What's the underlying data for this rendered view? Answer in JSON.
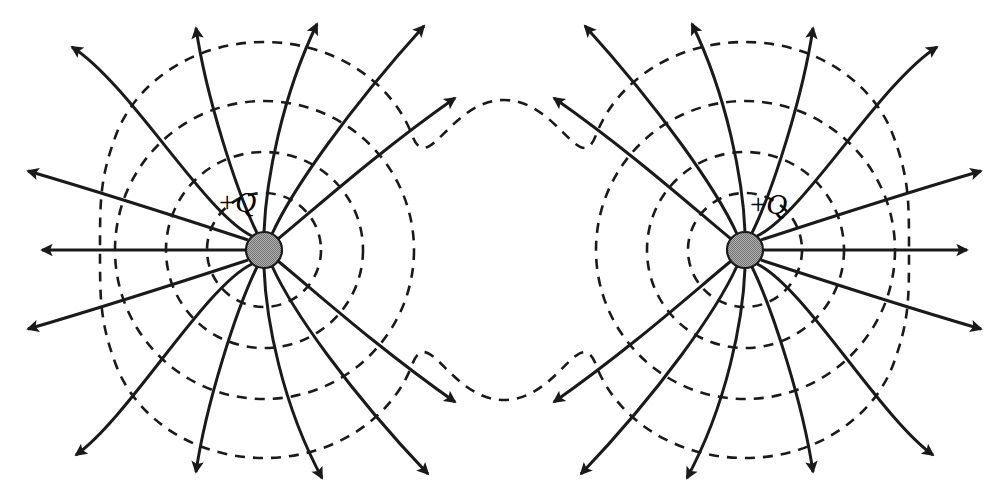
{
  "figure": {
    "background_color": "#ffffff",
    "width": 1005,
    "height": 500,
    "line_color": "#1a1a1a",
    "dash_color": "#1a1a1a",
    "charge_fill": "#999999",
    "charge_stroke": "#1a1a1a"
  },
  "charges": [
    {
      "id": "charge-left",
      "label": "+Q",
      "plus_sign": "+",
      "symbol": "Q",
      "sign": "positive",
      "cx": 264,
      "cy": 250,
      "radius": 18,
      "field_line_count": 13,
      "label_x": 219,
      "label_y": 186
    },
    {
      "id": "charge-right",
      "label": "+Q",
      "plus_sign": "+",
      "symbol": "Q",
      "sign": "positive",
      "cx": 745,
      "cy": 250,
      "radius": 18,
      "field_line_count": 13,
      "label_x": 750,
      "label_y": 188
    }
  ],
  "field_lines": {
    "style": "solid",
    "stroke_width": 3.0,
    "arrowhead": "filled-triangle",
    "direction": "outward",
    "description": "Solid field lines radiate outward from each positive charge, bending away from the midline between the two like charges."
  },
  "equipotentials": {
    "style": "dashed",
    "stroke_width": 2.6,
    "dash_pattern": "10 8",
    "rings_per_charge": 3,
    "ring_radii": [
      57,
      98,
      149
    ],
    "merged_outer_contour": true,
    "saddle_top_y": 95,
    "saddle_bottom_y": 405,
    "midpoint_x": 504,
    "description": "Dashed equipotential curves form concentric near-circles about each charge; the outermost contour merges into a single figure-eight shape with saddle dips above and below the midpoint."
  },
  "legend": {
    "solid_meaning": "electric field line",
    "dashed_meaning": "equipotential surface"
  }
}
